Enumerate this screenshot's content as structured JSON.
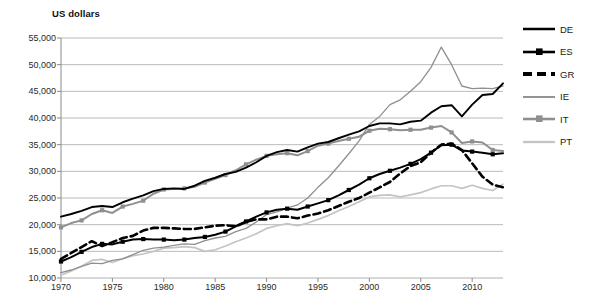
{
  "chart_data": {
    "type": "line",
    "title": "",
    "ylabel": "US dollars",
    "xlabel": "",
    "ylim": [
      10000,
      55000
    ],
    "xlim": [
      1970,
      2013
    ],
    "grid": true,
    "legend_position": "right",
    "yticks": [
      "10,000",
      "15,000",
      "20,000",
      "25,000",
      "30,000",
      "35,000",
      "40,000",
      "45,000",
      "50,000",
      "55,000"
    ],
    "ytick_values": [
      10000,
      15000,
      20000,
      25000,
      30000,
      35000,
      40000,
      45000,
      50000,
      55000
    ],
    "xticks": [
      "1970",
      "1975",
      "1980",
      "1985",
      "1990",
      "1995",
      "2000",
      "2005",
      "2010"
    ],
    "xtick_values": [
      1970,
      1975,
      1980,
      1985,
      1990,
      1995,
      2000,
      2005,
      2010
    ],
    "x": [
      1970,
      1971,
      1972,
      1973,
      1974,
      1975,
      1976,
      1977,
      1978,
      1979,
      1980,
      1981,
      1982,
      1983,
      1984,
      1985,
      1986,
      1987,
      1988,
      1989,
      1990,
      1991,
      1992,
      1993,
      1994,
      1995,
      1996,
      1997,
      1998,
      1999,
      2000,
      2001,
      2002,
      2003,
      2004,
      2005,
      2006,
      2007,
      2008,
      2009,
      2010,
      2011,
      2012,
      2013
    ],
    "series": [
      {
        "name": "DE",
        "color": "#000000",
        "style": "solid",
        "width": 1.9,
        "marker": "none",
        "values": [
          21500,
          22000,
          22600,
          23300,
          23500,
          23300,
          24200,
          24900,
          25500,
          26300,
          26700,
          26800,
          26700,
          27300,
          28200,
          28800,
          29500,
          29900,
          30700,
          31700,
          32900,
          33600,
          34000,
          33700,
          34500,
          35200,
          35500,
          36200,
          36900,
          37500,
          38500,
          39000,
          39000,
          38800,
          39300,
          39500,
          41000,
          42200,
          42400,
          40300,
          42500,
          44300,
          44500,
          46500
        ]
      },
      {
        "name": "ES",
        "color": "#000000",
        "style": "solid",
        "width": 2.0,
        "marker": "square",
        "values": [
          13100,
          13900,
          14900,
          15800,
          16400,
          16300,
          16800,
          17200,
          17300,
          17200,
          17200,
          17100,
          17200,
          17500,
          17700,
          18100,
          18700,
          19700,
          20600,
          21500,
          22300,
          22800,
          23000,
          22800,
          23400,
          24000,
          24600,
          25500,
          26500,
          27500,
          28700,
          29500,
          30100,
          30700,
          31400,
          32300,
          33500,
          34900,
          35000,
          33900,
          33700,
          33500,
          33200,
          33400
        ]
      },
      {
        "name": "GR",
        "color": "#000000",
        "style": "dashed",
        "width": 2.6,
        "marker": "none",
        "values": [
          13600,
          14700,
          15800,
          16900,
          16000,
          16700,
          17500,
          17900,
          18900,
          19400,
          19400,
          19300,
          19200,
          19200,
          19500,
          19800,
          19900,
          19700,
          20500,
          21000,
          21000,
          21500,
          21500,
          21200,
          21700,
          22100,
          22700,
          23500,
          24300,
          25000,
          26000,
          27000,
          28000,
          29600,
          31000,
          31700,
          33500,
          35000,
          35200,
          34000,
          31500,
          29000,
          27500,
          27000
        ]
      },
      {
        "name": "IE",
        "color": "#8f8f8f",
        "style": "solid",
        "width": 1.3,
        "marker": "none",
        "values": [
          11000,
          11500,
          12200,
          12800,
          12700,
          13300,
          13600,
          14400,
          15200,
          15600,
          15800,
          16100,
          16400,
          16300,
          17000,
          17500,
          17800,
          18700,
          19300,
          20500,
          21900,
          22400,
          23100,
          23700,
          25000,
          27000,
          28800,
          31000,
          33300,
          35700,
          38800,
          40300,
          42500,
          43400,
          45000,
          46800,
          49500,
          53300,
          50000,
          46000,
          45500,
          45600,
          45500,
          46000
        ]
      },
      {
        "name": "IT",
        "color": "#8f8f8f",
        "style": "solid",
        "width": 2.0,
        "marker": "square",
        "values": [
          19500,
          20300,
          20800,
          22000,
          22700,
          22200,
          23400,
          23900,
          24500,
          25800,
          26600,
          26700,
          26800,
          27100,
          27900,
          28600,
          29300,
          30200,
          31300,
          32200,
          32900,
          33200,
          33400,
          33000,
          33800,
          34800,
          35200,
          35700,
          36100,
          36500,
          37600,
          38000,
          37900,
          37700,
          37800,
          37800,
          38200,
          38500,
          37300,
          35300,
          35600,
          35400,
          34000,
          33800
        ]
      },
      {
        "name": "PT",
        "color": "#c4c4c4",
        "style": "solid",
        "width": 1.7,
        "marker": "none",
        "values": [
          10500,
          11300,
          12200,
          13300,
          13500,
          12900,
          13600,
          14200,
          14500,
          15000,
          15600,
          15700,
          15900,
          15700,
          15000,
          15300,
          16000,
          16800,
          17500,
          18300,
          19300,
          19800,
          20200,
          19800,
          20300,
          21000,
          21700,
          22600,
          23400,
          24300,
          25200,
          25500,
          25600,
          25200,
          25600,
          26000,
          26700,
          27300,
          27300,
          26800,
          27400,
          26800,
          26400,
          27600
        ]
      }
    ]
  },
  "legend": {
    "items": [
      {
        "label": "DE"
      },
      {
        "label": "ES"
      },
      {
        "label": "GR"
      },
      {
        "label": "IE"
      },
      {
        "label": "IT"
      },
      {
        "label": "PT"
      }
    ]
  }
}
